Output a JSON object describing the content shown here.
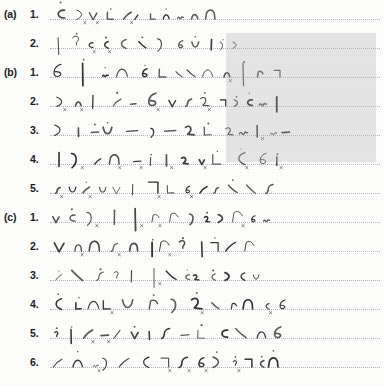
{
  "document": {
    "title": "Handwritten shorthand manuscript page",
    "description": "Scanned page of handwritten shorthand (stenographic outlines) arranged in three labelled groups with numbered lines written on faint dotted ruled baselines.",
    "background_color": "#fdfdfc",
    "ink_color": "#2a2a2a",
    "baseline_color": "#9aa0a6"
  },
  "highlight": {
    "name": "gray-selection-overlay",
    "color": "#b0b0b0",
    "opacity": "0.30",
    "x": 226,
    "y": 33,
    "width": 150,
    "height": 129
  },
  "groups": [
    {
      "label": "(a)",
      "lines": [
        {
          "number": "1.",
          "content_type": "shorthand-outlines",
          "stroke_count": 11
        },
        {
          "number": "2.",
          "content_type": "shorthand-outlines",
          "stroke_count": 12
        }
      ]
    },
    {
      "label": "(b)",
      "lines": [
        {
          "number": "1.",
          "content_type": "shorthand-outlines",
          "stroke_count": 13
        },
        {
          "number": "2.",
          "content_type": "shorthand-outlines",
          "stroke_count": 14
        },
        {
          "number": "3.",
          "content_type": "shorthand-outlines",
          "stroke_count": 14
        },
        {
          "number": "4.",
          "content_type": "shorthand-outlines",
          "stroke_count": 13
        },
        {
          "number": "5.",
          "content_type": "shorthand-outlines",
          "stroke_count": 14
        }
      ]
    },
    {
      "label": "(c)",
      "lines": [
        {
          "number": "1.",
          "content_type": "shorthand-outlines",
          "stroke_count": 13
        },
        {
          "number": "2.",
          "content_type": "shorthand-outlines",
          "stroke_count": 12
        },
        {
          "number": "3.",
          "content_type": "shorthand-outlines",
          "stroke_count": 13
        },
        {
          "number": "4.",
          "content_type": "shorthand-outlines",
          "stroke_count": 13
        },
        {
          "number": "5.",
          "content_type": "shorthand-outlines",
          "stroke_count": 14
        },
        {
          "number": "6.",
          "content_type": "shorthand-outlines",
          "stroke_count": 14
        }
      ]
    }
  ],
  "layout": {
    "first_row_top": 8,
    "row_height": 29,
    "stroke_area_left": 50,
    "baseline_offset": 19
  }
}
